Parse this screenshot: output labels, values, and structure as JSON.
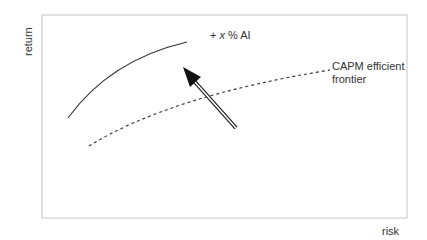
{
  "diagram": {
    "y_axis_label": "return",
    "x_axis_label": "risk",
    "annotation_ai": {
      "prefix": "+ ",
      "var": "x",
      "suffix": " % AI"
    },
    "frontier_label_line1": "CAPM efficient",
    "frontier_label_line2": "frontier",
    "colors": {
      "frame": "#bdbdbd",
      "curve": "#333333",
      "arrow": "#111111"
    }
  }
}
